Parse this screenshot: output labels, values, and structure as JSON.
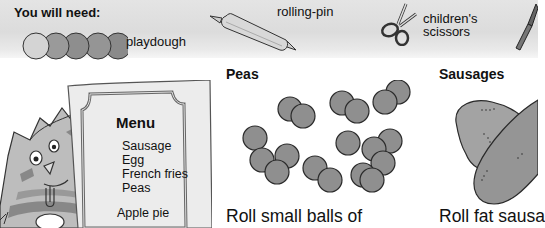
{
  "needs": {
    "title": "You will need:",
    "items": [
      {
        "name": "playdough",
        "label": "playdough",
        "icon": "playdough-balls-icon"
      },
      {
        "name": "rolling-pin",
        "label": "rolling-pin",
        "icon": "rolling-pin-icon"
      },
      {
        "name": "scissors",
        "label_line1": "children's",
        "label_line2": "scissors",
        "icon": "scissors-icon"
      },
      {
        "name": "knife",
        "icon": "knife-icon"
      }
    ]
  },
  "menu": {
    "title": "Menu",
    "items": [
      "Sausage",
      "Egg",
      "French fries",
      "Peas"
    ],
    "dessert": "Apple pie"
  },
  "sections": [
    {
      "title": "Peas",
      "text": "Roll small balls of"
    },
    {
      "title": "Sausages",
      "text": "Roll fat sausa"
    }
  ],
  "colors": {
    "banner": "#e0e0e0",
    "pea_fill": "#8c8c8c",
    "sausage_fill": "#9a9a9a",
    "outline": "#222222"
  }
}
